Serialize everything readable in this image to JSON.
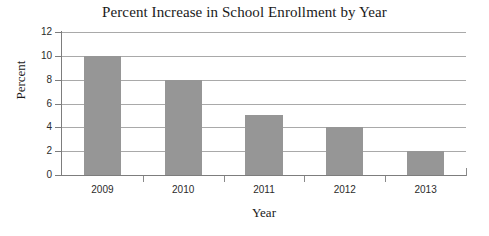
{
  "chart_data": {
    "type": "bar",
    "title": "Percent Increase in School Enrollment by Year",
    "xlabel": "Year",
    "ylabel": "Percent",
    "categories": [
      "2009",
      "2010",
      "2011",
      "2012",
      "2013"
    ],
    "values": [
      10,
      8,
      5,
      4,
      2
    ],
    "series": [
      {
        "name": "Percent Increase",
        "values": [
          10,
          8,
          5,
          4,
          2
        ]
      }
    ],
    "ylim": [
      0,
      12
    ],
    "y_ticks": [
      0,
      2,
      4,
      6,
      8,
      10,
      12
    ],
    "y_tick_labels": [
      "0",
      "2",
      "4",
      "6",
      "8",
      "10",
      "12"
    ],
    "grid": "horizontal",
    "legend": "none",
    "bar_color": "#969696",
    "gridline_color": "#a9a9a9",
    "axis_color": "#7d7d7d",
    "background_color": "#ffffff",
    "text_color": "#1a1a1a"
  }
}
